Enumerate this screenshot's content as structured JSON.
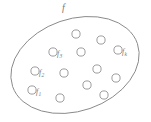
{
  "figure": {
    "name": "set-diagram",
    "background_color": "#ffffff",
    "stroke_color": "#8a8a8a",
    "text_color": "#7a7a7a",
    "width": 151,
    "height": 122
  },
  "set": {
    "label": "f",
    "label_name": "set-label-f",
    "shape": "ellipse",
    "center_x": 75,
    "center_y": 65,
    "radius_x": 66,
    "radius_y": 46,
    "rotation_deg": -19,
    "label_x": 62,
    "label_y": 3,
    "label_font_size": 10
  },
  "elements": {
    "total_count": 13,
    "labeled_count": 4,
    "unlabeled_count": 9,
    "radius": 4.1,
    "items": [
      {
        "id": "f1",
        "label": "f",
        "sub": "1",
        "cx": 32,
        "cy": 90,
        "labeled": true,
        "label_x": 36,
        "label_y": 88
      },
      {
        "id": "f2",
        "label": "f",
        "sub": "2",
        "cx": 35,
        "cy": 71,
        "labeled": true,
        "label_x": 39,
        "label_y": 69
      },
      {
        "id": "f3",
        "label": "f",
        "sub": "3",
        "cx": 53,
        "cy": 52,
        "labeled": true,
        "label_x": 57,
        "label_y": 50
      },
      {
        "id": "fk",
        "label": "f",
        "sub": "k",
        "cx": 118,
        "cy": 50,
        "labeled": true,
        "label_x": 122,
        "label_y": 48
      },
      {
        "id": "u1",
        "label": "",
        "sub": "",
        "cx": 76,
        "cy": 34,
        "labeled": false,
        "label_x": 0,
        "label_y": 0
      },
      {
        "id": "u2",
        "label": "",
        "sub": "",
        "cx": 101,
        "cy": 40,
        "labeled": false,
        "label_x": 0,
        "label_y": 0
      },
      {
        "id": "u3",
        "label": "",
        "sub": "",
        "cx": 81,
        "cy": 52,
        "labeled": false,
        "label_x": 0,
        "label_y": 0
      },
      {
        "id": "u4",
        "label": "",
        "sub": "",
        "cx": 64,
        "cy": 73,
        "labeled": false,
        "label_x": 0,
        "label_y": 0
      },
      {
        "id": "u5",
        "label": "",
        "sub": "",
        "cx": 97,
        "cy": 69,
        "labeled": false,
        "label_x": 0,
        "label_y": 0
      },
      {
        "id": "u6",
        "label": "",
        "sub": "",
        "cx": 116,
        "cy": 78,
        "labeled": false,
        "label_x": 0,
        "label_y": 0
      },
      {
        "id": "u7",
        "label": "",
        "sub": "",
        "cx": 87,
        "cy": 85,
        "labeled": false,
        "label_x": 0,
        "label_y": 0
      },
      {
        "id": "u8",
        "label": "",
        "sub": "",
        "cx": 60,
        "cy": 98,
        "labeled": false,
        "label_x": 0,
        "label_y": 0
      },
      {
        "id": "u9",
        "label": "",
        "sub": "",
        "cx": 104,
        "cy": 95,
        "labeled": false,
        "label_x": 0,
        "label_y": 0
      }
    ]
  }
}
